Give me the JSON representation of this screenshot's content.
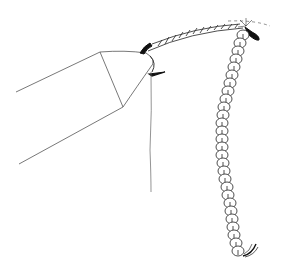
{
  "illustration": {
    "subject": "crochet hook working a foundation chain",
    "colors": {
      "background": "#ffffff",
      "ink": "#1a1a1a",
      "thin_line": "#555555"
    },
    "parts": [
      {
        "name": "crochet-hook",
        "description": "hook shaft with tapered head"
      },
      {
        "name": "working-yarn",
        "description": "yarn strand hanging from hook"
      },
      {
        "name": "yarn-over-strand",
        "description": "hatched twisted yarn across top"
      },
      {
        "name": "stitch-chain",
        "description": "vertical chain of loops"
      },
      {
        "name": "yarn-tail",
        "description": "loose end at bottom of chain"
      }
    ],
    "chain_stitch_count": 24
  }
}
